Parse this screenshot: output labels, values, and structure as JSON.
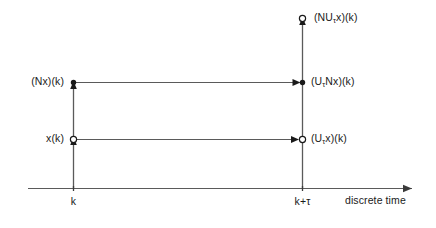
{
  "figure": {
    "name": "discrete-time-operator-diagram",
    "background_color": "#ffffff",
    "line_color": "#5a5a5a",
    "marker_color": "#1a1a1a",
    "text_color": "#1a1a1a"
  },
  "axis": {
    "name": "discrete-time-axis",
    "label": "discrete time",
    "ticks": [
      {
        "label": "k",
        "position_px": 73
      },
      {
        "label": "k+τ",
        "position_px": 302
      }
    ]
  },
  "nodes": [
    {
      "id": "node-nu-tau-x",
      "label_prefix": "(NU",
      "label_subscript": "τ",
      "label_suffix": "x)(k)",
      "label_text": "(NUτx)(k)",
      "marker": "open-circle",
      "x_px": 302,
      "y_px": 18,
      "label_side": "right"
    },
    {
      "id": "node-nx",
      "label_prefix": "(Nx)(k)",
      "label_subscript": "",
      "label_suffix": "",
      "label_text": "(Nx)(k)",
      "marker": "filled-dot",
      "x_px": 73,
      "y_px": 82,
      "label_side": "left"
    },
    {
      "id": "node-u-tau-nx",
      "label_prefix": "(U",
      "label_subscript": "τ",
      "label_suffix": "Nx)(k)",
      "label_text": "(UτNx)(k)",
      "marker": "filled-dot",
      "x_px": 302,
      "y_px": 82,
      "label_side": "right"
    },
    {
      "id": "node-x",
      "label_prefix": "x(k)",
      "label_subscript": "",
      "label_suffix": "",
      "label_text": "x(k)",
      "marker": "open-circle",
      "x_px": 73,
      "y_px": 139,
      "label_side": "left"
    },
    {
      "id": "node-u-tau-x",
      "label_prefix": "(U",
      "label_subscript": "τ",
      "label_suffix": "x)(k)",
      "label_text": "(Uτx)(k)",
      "marker": "open-circle",
      "x_px": 302,
      "y_px": 139,
      "label_side": "right"
    }
  ],
  "arrows": [
    {
      "id": "arrow-nx-to-u-tau-nx",
      "direction": "right",
      "from": "node-nx",
      "to": "node-u-tau-nx"
    },
    {
      "id": "arrow-x-to-u-tau-x",
      "direction": "right",
      "from": "node-x",
      "to": "node-u-tau-x"
    },
    {
      "id": "arrow-x-to-nx",
      "direction": "up",
      "from": "node-x",
      "to": "node-nx"
    },
    {
      "id": "arrow-u-tau-x-to-nu-tau-x",
      "direction": "up",
      "from": "node-u-tau-x",
      "to": "node-nu-tau-x"
    }
  ]
}
